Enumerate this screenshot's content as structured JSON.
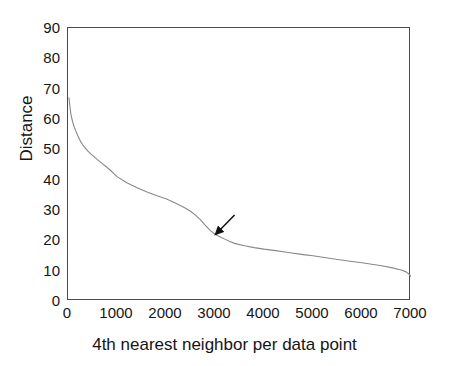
{
  "chart_data": {
    "type": "line",
    "title": "",
    "xlabel": "4th nearest neighbor per data point",
    "ylabel": "Distance",
    "xlim": [
      0,
      7000
    ],
    "ylim": [
      0,
      90
    ],
    "xticks": [
      0,
      1000,
      2000,
      3000,
      4000,
      5000,
      6000,
      7000
    ],
    "yticks": [
      0,
      10,
      20,
      30,
      40,
      50,
      60,
      70,
      80,
      90
    ],
    "xtick_labels": [
      "0",
      "1000",
      "2000",
      "3000",
      "4000",
      "5000",
      "6000",
      "7000"
    ],
    "ytick_labels": [
      "0",
      "10",
      "20",
      "30",
      "40",
      "50",
      "60",
      "70",
      "80",
      "90"
    ],
    "grid": false,
    "legend": null,
    "series": [
      {
        "name": "sorted 4th-nearest-neighbor distance",
        "color": "#888888",
        "x": [
          20,
          40,
          60,
          80,
          100,
          130,
          160,
          200,
          250,
          300,
          400,
          500,
          600,
          700,
          800,
          900,
          1000,
          1200,
          1400,
          1600,
          1800,
          2000,
          2200,
          2400,
          2500,
          2600,
          2700,
          2800,
          2900,
          3000,
          3100,
          3200,
          3300,
          3400,
          3600,
          3800,
          4000,
          4200,
          4500,
          4800,
          5000,
          5200,
          5500,
          5800,
          6000,
          6200,
          6400,
          6600,
          6800,
          6900,
          6950,
          7000
        ],
        "y": [
          67.0,
          64.0,
          61.5,
          60.0,
          58.8,
          57.2,
          56.0,
          54.5,
          52.8,
          51.5,
          49.5,
          48.0,
          46.6,
          45.3,
          44.0,
          42.6,
          41.0,
          39.0,
          37.4,
          36.0,
          34.8,
          33.7,
          32.2,
          30.6,
          29.6,
          28.3,
          26.8,
          25.0,
          23.3,
          22.0,
          21.2,
          20.4,
          19.6,
          19.0,
          18.2,
          17.6,
          17.1,
          16.7,
          16.0,
          15.3,
          14.9,
          14.4,
          13.7,
          13.0,
          12.6,
          12.1,
          11.6,
          11.0,
          10.2,
          9.6,
          9.0,
          8.0
        ]
      }
    ],
    "annotations": [
      {
        "type": "arrow",
        "label": "knee-marker",
        "tail_xy": [
          3420,
          28.0
        ],
        "tip_xy": [
          3030,
          21.6
        ],
        "color": "#111111"
      }
    ]
  },
  "axis": {
    "ylabel_text": "Distance",
    "xlabel_text": "4th nearest neighbor per data point"
  }
}
